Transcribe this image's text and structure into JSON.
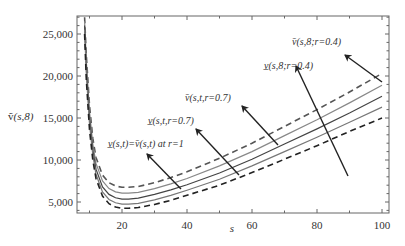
{
  "chart_data": {
    "type": "line",
    "title": "",
    "xlabel": "s",
    "ylabel": "ṽ(s,8)",
    "xlim": [
      6,
      102
    ],
    "ylim": [
      3700,
      27100
    ],
    "xticks": [
      20,
      40,
      60,
      80,
      100
    ],
    "yticks": [
      5000,
      10000,
      15000,
      20000,
      25000
    ],
    "xtick_labels": [
      "20",
      "40",
      "60",
      "80",
      "100"
    ],
    "ytick_labels": [
      "5,000",
      "10,000",
      "15,000",
      "20,000",
      "25,000"
    ],
    "grid": false,
    "legend": "none (inline annotations with arrows)",
    "x": [
      8.5,
      9,
      10,
      11,
      12,
      14,
      16,
      18,
      20,
      22,
      25,
      30,
      35,
      40,
      50,
      60,
      70,
      80,
      90,
      100
    ],
    "series": [
      {
        "name": "v̄(s,8;r=0.4)",
        "style": "dashed",
        "color": "#555555",
        "values": [
          27000,
          22500,
          16500,
          12600,
          10300,
          8200,
          7300,
          6900,
          6750,
          6750,
          6850,
          7300,
          7900,
          8600,
          10200,
          12000,
          14000,
          16000,
          18100,
          20300
        ]
      },
      {
        "name": "v̄(s,t,r=0.7)",
        "style": "solid",
        "color": "#888888",
        "values": [
          26500,
          21800,
          15800,
          11900,
          9600,
          7500,
          6600,
          6200,
          6050,
          6050,
          6150,
          6600,
          7150,
          7800,
          9300,
          11000,
          12900,
          14800,
          16800,
          18900
        ]
      },
      {
        "name": "v(s,t)=v̄(s,t) at r=1",
        "style": "solid",
        "color": "#444444",
        "values": [
          26000,
          21000,
          15000,
          11200,
          8900,
          6800,
          5900,
          5500,
          5350,
          5350,
          5450,
          5900,
          6450,
          7050,
          8450,
          10100,
          11900,
          13700,
          15600,
          17600
        ]
      },
      {
        "name": "v̲(s,t,r=0.7)",
        "style": "solid",
        "color": "#777777",
        "values": [
          25500,
          20300,
          14300,
          10600,
          8300,
          6200,
          5300,
          4900,
          4750,
          4750,
          4850,
          5250,
          5800,
          6400,
          7700,
          9300,
          11000,
          12700,
          14500,
          16300
        ]
      },
      {
        "name": "v̲(s,8;r=0.4)",
        "style": "dashed",
        "color": "#222222",
        "values": [
          25000,
          19600,
          13600,
          10000,
          7800,
          5700,
          4800,
          4400,
          4250,
          4250,
          4350,
          4700,
          5200,
          5800,
          7000,
          8500,
          10100,
          11700,
          13400,
          15000
        ]
      }
    ],
    "annotations": [
      {
        "text": "v̄(s,8;r=0.4)",
        "text_pos": [
          292,
          45
        ],
        "arrow_from": [
          382,
          82
        ],
        "arrow_to": [
          345,
          55
        ]
      },
      {
        "text": "v̲(s,8;r=0.4)",
        "text_pos": [
          264,
          69
        ],
        "arrow_from": [
          348,
          176
        ],
        "arrow_to": [
          296,
          66
        ]
      },
      {
        "text": "v̄(s,t,r=0.7)",
        "text_pos": [
          185,
          101
        ],
        "arrow_from": [
          278,
          145
        ],
        "arrow_to": [
          242,
          106
        ]
      },
      {
        "text": "v̲(s,t,r=0.7)",
        "text_pos": [
          148,
          124
        ],
        "arrow_from": [
          239,
          175
        ],
        "arrow_to": [
          196,
          129
        ]
      },
      {
        "text": "v̲(s,t)=v̄(s,t) at r=1",
        "text_pos": [
          108,
          147
        ],
        "arrow_from": [
          181,
          189
        ],
        "arrow_to": [
          147,
          154
        ]
      }
    ]
  },
  "axis": {
    "xlabel": "s",
    "ylabel_main": "ṽ",
    "ylabel_args": "(s,8)"
  }
}
